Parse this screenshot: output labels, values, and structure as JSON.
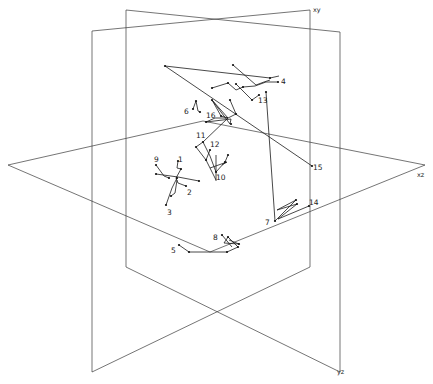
{
  "figure": {
    "type": "3d-trajectory-diagram",
    "planes": [
      {
        "name": "xy",
        "label": "xy",
        "label_pos": [
          313,
          12
        ]
      },
      {
        "name": "xz",
        "label": "xz",
        "label_pos": [
          417,
          177
        ]
      },
      {
        "name": "yz",
        "label": "yz",
        "label_pos": [
          337,
          374
        ]
      }
    ],
    "track_labels": [
      {
        "id": "1",
        "text": "1",
        "pos": [
          178,
          162
        ]
      },
      {
        "id": "2",
        "text": "2",
        "pos": [
          187,
          195
        ]
      },
      {
        "id": "3",
        "text": "3",
        "pos": [
          167,
          215
        ]
      },
      {
        "id": "4",
        "text": "4",
        "pos": [
          281,
          84
        ]
      },
      {
        "id": "5",
        "text": "5",
        "pos": [
          171,
          253
        ]
      },
      {
        "id": "6",
        "text": "6",
        "pos": [
          184,
          114
        ]
      },
      {
        "id": "7",
        "text": "7",
        "pos": [
          265,
          225
        ]
      },
      {
        "id": "8",
        "text": "8",
        "pos": [
          213,
          240
        ]
      },
      {
        "id": "9",
        "text": "9",
        "pos": [
          154,
          162
        ]
      },
      {
        "id": "10",
        "text": "10",
        "pos": [
          216,
          180
        ]
      },
      {
        "id": "11",
        "text": "11",
        "pos": [
          196,
          138
        ]
      },
      {
        "id": "12",
        "text": "12",
        "pos": [
          210,
          147
        ]
      },
      {
        "id": "13",
        "text": "13",
        "pos": [
          258,
          103
        ]
      },
      {
        "id": "14",
        "text": "14",
        "pos": [
          309,
          205
        ]
      },
      {
        "id": "15",
        "text": "15",
        "pos": [
          313,
          170
        ]
      },
      {
        "id": "16",
        "text": "16",
        "pos": [
          206,
          118
        ]
      }
    ],
    "caption": "Fig. 2. Trajectories ..."
  }
}
